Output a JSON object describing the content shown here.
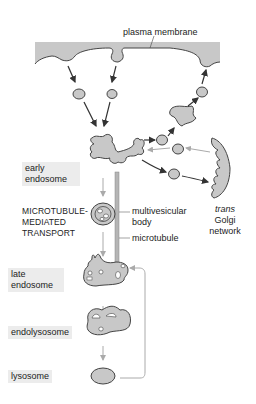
{
  "diagram": {
    "labels": {
      "plasma_membrane": "plasma membrane",
      "early_endosome_line1": "early",
      "early_endosome_line2": "endosome",
      "mt_transport_line1": "MICROTUBULE-",
      "mt_transport_line2": "MEDIATED",
      "mt_transport_line3": "TRANSPORT",
      "mvb_line1": "multivesicular",
      "mvb_line2": "body",
      "microtubule": "microtubule",
      "tgn_line1": "trans",
      "tgn_line2": "Golgi",
      "tgn_line3": "network",
      "late_endosome_line1": "late",
      "late_endosome_line2": "endosome",
      "endolysosome": "endolysosome",
      "lysosome": "lysosome"
    },
    "colors": {
      "organelle_fill": "#c8c8c8",
      "outline": "#444444",
      "arrow_dark": "#333333",
      "arrow_light": "#aaaaaa",
      "label_box": "#ececec"
    }
  }
}
